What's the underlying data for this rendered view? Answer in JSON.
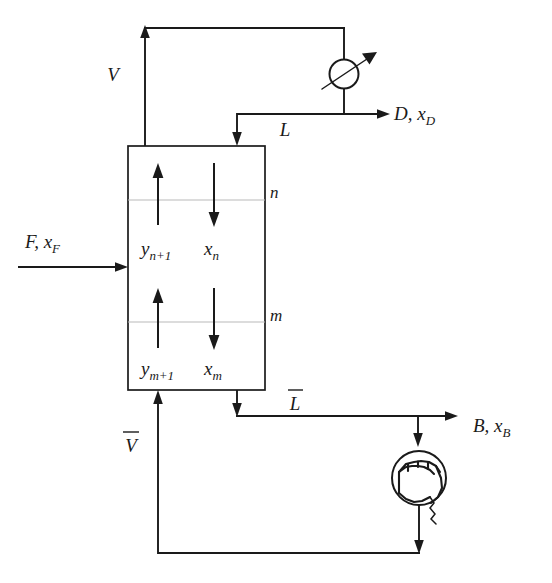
{
  "figure": {
    "kind": "process-flow-diagram",
    "background_color": "#ffffff",
    "line_color": "#1a1a1a",
    "tray_line_color": "#b9b9b9"
  },
  "labels": {
    "vapor_overhead": "V",
    "reflux": "L",
    "distillate": "D, x",
    "distillate_sub": "D",
    "feed": "F, x",
    "feed_sub": "F",
    "bottoms": "B, x",
    "bottoms_sub": "B",
    "stripping_liquid": "L",
    "stripping_vapor": "V",
    "stage_n": "n",
    "stage_m": "m",
    "vapor_n1": "y",
    "vapor_n1_sub": "n+1",
    "liquid_n": "x",
    "liquid_n_sub": "n",
    "vapor_m1": "y",
    "vapor_m1_sub": "m+1",
    "liquid_m": "x",
    "liquid_m_sub": "m"
  },
  "equipment": {
    "column_name": "distillation-column-shell",
    "condenser_name": "condenser",
    "reboiler_name": "reboiler"
  },
  "streams": [
    {
      "id": "vapor-overhead",
      "label": "V",
      "direction": "up"
    },
    {
      "id": "reflux",
      "label": "L",
      "direction": "down"
    },
    {
      "id": "distillate",
      "label": "D, xD",
      "direction": "right"
    },
    {
      "id": "feed",
      "label": "F, xF",
      "direction": "right"
    },
    {
      "id": "bottoms",
      "label": "B, xB",
      "direction": "right"
    },
    {
      "id": "stripping-liquid",
      "label": "L-bar",
      "direction": "down"
    },
    {
      "id": "stripping-vapor",
      "label": "V-bar",
      "direction": "up"
    }
  ]
}
